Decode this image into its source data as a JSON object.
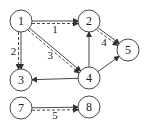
{
  "diagram": {
    "type": "directed-graph",
    "nodes": [
      {
        "id": "1",
        "label": "1",
        "x": 21,
        "y": 21
      },
      {
        "id": "2",
        "label": "2",
        "x": 89,
        "y": 21
      },
      {
        "id": "3",
        "label": "3",
        "x": 21,
        "y": 80
      },
      {
        "id": "4",
        "label": "4",
        "x": 89,
        "y": 78
      },
      {
        "id": "5",
        "label": "5",
        "x": 128,
        "y": 50
      },
      {
        "id": "7",
        "label": "7",
        "x": 21,
        "y": 108
      },
      {
        "id": "8",
        "label": "8",
        "x": 89,
        "y": 107
      }
    ],
    "edges": [
      {
        "from": "1",
        "to": "2",
        "style": "solid"
      },
      {
        "from": "1",
        "to": "3",
        "style": "solid"
      },
      {
        "from": "1",
        "to": "4",
        "style": "solid"
      },
      {
        "from": "2",
        "to": "5",
        "style": "solid"
      },
      {
        "from": "4",
        "to": "2",
        "style": "solid"
      },
      {
        "from": "4",
        "to": "3",
        "style": "solid"
      },
      {
        "from": "4",
        "to": "5",
        "style": "solid"
      },
      {
        "from": "7",
        "to": "8",
        "style": "solid"
      }
    ],
    "dashed_paths": [
      {
        "from": "1",
        "to": "2",
        "label": "1"
      },
      {
        "from": "1",
        "to": "3",
        "label": "2"
      },
      {
        "from": "1",
        "to": "4",
        "label": "3"
      },
      {
        "from": "2",
        "to": "5",
        "label": "4"
      },
      {
        "from": "7",
        "to": "8",
        "label": "5"
      }
    ],
    "colors": {
      "stroke": "#333333",
      "fill": "#ffffff",
      "text": "#222222"
    }
  }
}
